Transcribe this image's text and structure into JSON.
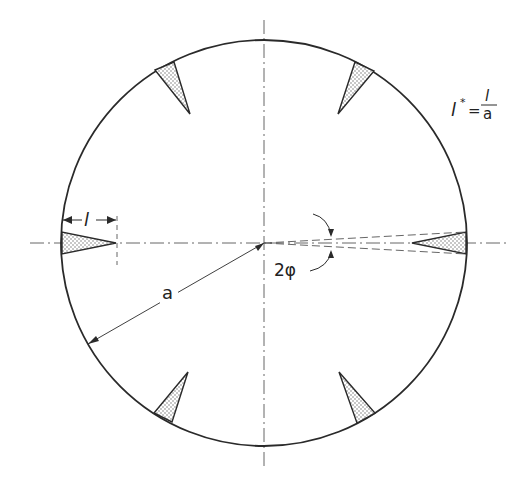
{
  "diagram": {
    "colors": {
      "stroke": "#2a2a2a",
      "fill_stipple": "#9a9a9a",
      "background": "#ffffff"
    },
    "labels": {
      "crack_length": "l",
      "radius": "a",
      "angle": "2φ",
      "normalized_formula_lhs": "l",
      "normalized_formula_star": "*",
      "normalized_formula_eq": "=",
      "normalized_formula_num": "l",
      "normalized_formula_den": "a"
    },
    "notches": [
      {
        "position": "left",
        "angle_deg": 180
      },
      {
        "position": "right",
        "angle_deg": 0
      },
      {
        "position": "upper-left",
        "angle_deg": 120
      },
      {
        "position": "upper-right",
        "angle_deg": 60
      },
      {
        "position": "lower-left",
        "angle_deg": 240
      },
      {
        "position": "lower-right",
        "angle_deg": 300
      }
    ]
  }
}
